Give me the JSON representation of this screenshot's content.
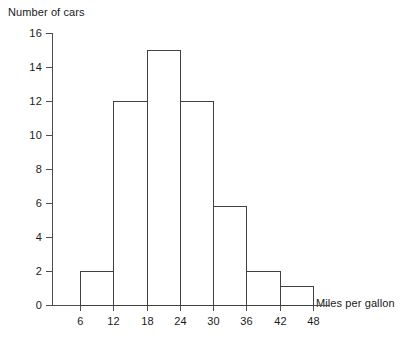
{
  "chart_data": {
    "type": "bar",
    "title": "",
    "subtitle": "",
    "xlabel": "Miles per gallon",
    "ylabel": "Number of cars",
    "bin_edges": [
      6,
      12,
      18,
      24,
      30,
      36,
      42,
      48
    ],
    "categories": [
      "6-12",
      "12-18",
      "18-24",
      "24-30",
      "30-36",
      "36-42",
      "42-48"
    ],
    "values": [
      2,
      12,
      15,
      12,
      5.8,
      2,
      1.1
    ],
    "bars": [
      {
        "label": "6-12",
        "start": 6,
        "end": 12,
        "value": 2
      },
      {
        "label": "12-18",
        "start": 12,
        "end": 18,
        "value": 12
      },
      {
        "label": "18-24",
        "start": 18,
        "end": 24,
        "value": 15
      },
      {
        "label": "24-30",
        "start": 24,
        "end": 30,
        "value": 12
      },
      {
        "label": "30-36",
        "start": 30,
        "end": 36,
        "value": 5.8
      },
      {
        "label": "36-42",
        "start": 36,
        "end": 42,
        "value": 2
      },
      {
        "label": "42-48",
        "start": 42,
        "end": 48,
        "value": 1.1
      }
    ],
    "xlim": [
      0,
      51
    ],
    "ylim": [
      0,
      16
    ],
    "xticks": [
      6,
      12,
      18,
      24,
      30,
      36,
      42,
      48
    ],
    "xtick_labels": [
      "6",
      "12",
      "18",
      "24",
      "30",
      "36",
      "42",
      "48"
    ],
    "yticks": [
      0,
      2,
      4,
      6,
      8,
      10,
      12,
      14,
      16
    ],
    "ytick_labels": [
      "0",
      "2",
      "4",
      "6",
      "8",
      "10",
      "12",
      "14",
      "16"
    ],
    "grid": false,
    "legend": false,
    "bar_fill_color": "#ffffff",
    "bar_edge_color": "#404040",
    "axis_color": "#4d4d4d",
    "background_color": "#ffffff"
  }
}
